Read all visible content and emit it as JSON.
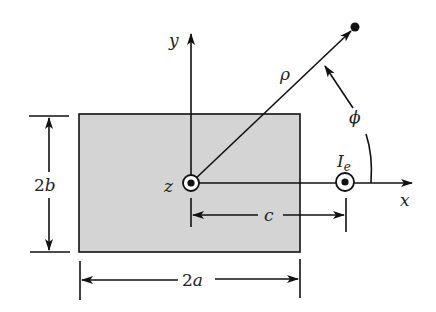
{
  "figure": {
    "colors": {
      "background": "#ffffff",
      "rectangle_fill": "#d4d4d4",
      "stroke": "#111111"
    },
    "labels": {
      "y_axis": "y",
      "x_axis": "x",
      "z_axis": "z",
      "rho": "ρ",
      "phi": "ϕ",
      "current_main": "I",
      "current_sub": "e",
      "height_dim_num": "2",
      "height_dim_var": "b",
      "width_dim_num": "2",
      "width_dim_var": "a",
      "offset_dim": "c"
    }
  }
}
